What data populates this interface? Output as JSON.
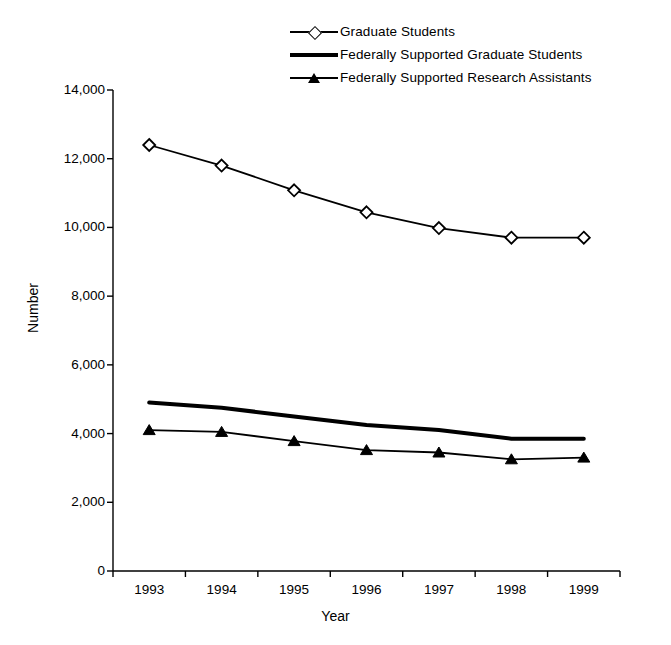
{
  "chart_data": {
    "type": "line",
    "title": "",
    "xlabel": "Year",
    "ylabel": "Number",
    "categories": [
      "1993",
      "1994",
      "1995",
      "1996",
      "1997",
      "1998",
      "1999"
    ],
    "x": [
      1993,
      1994,
      1995,
      1996,
      1997,
      1998,
      1999
    ],
    "ylim": [
      0,
      14000
    ],
    "yticks": [
      0,
      2000,
      4000,
      6000,
      8000,
      10000,
      12000,
      14000
    ],
    "ytick_labels": [
      "0",
      "2,000",
      "4,000",
      "6,000",
      "8,000",
      "10,000",
      "12,000",
      "14,000"
    ],
    "grid": false,
    "legend_position": "top-center",
    "series": [
      {
        "name": "Graduate Students",
        "marker": "open-diamond",
        "line": "thin",
        "color": "#000000",
        "values": [
          12400,
          11800,
          11080,
          10440,
          9980,
          9700,
          9700
        ]
      },
      {
        "name": "Federally Supported Graduate Students",
        "marker": "none",
        "line": "thick",
        "color": "#000000",
        "values": [
          4900,
          4750,
          4500,
          4250,
          4100,
          3850,
          3850
        ]
      },
      {
        "name": "Federally Supported Research Assistants",
        "marker": "filled-triangle",
        "line": "thin",
        "color": "#000000",
        "values": [
          4100,
          4050,
          3780,
          3520,
          3450,
          3250,
          3300
        ]
      }
    ]
  },
  "legend": {
    "items": [
      {
        "label": "Graduate Students",
        "key": "diamond-line-key"
      },
      {
        "label": "Federally Supported Graduate Students",
        "key": "thick-line-key"
      },
      {
        "label": "Federally Supported Research Assistants",
        "key": "triangle-line-key"
      }
    ]
  },
  "axes": {
    "y_title": "Number",
    "x_title": "Year",
    "y_tick_labels": [
      "14,000",
      "12,000",
      "10,000",
      "8,000",
      "6,000",
      "4,000",
      "2,000",
      "0"
    ],
    "x_tick_labels": [
      "1993",
      "1994",
      "1995",
      "1996",
      "1997",
      "1998",
      "1999"
    ]
  }
}
